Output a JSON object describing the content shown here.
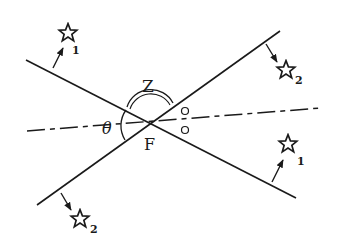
{
  "diagram": {
    "labels": {
      "zenith": "Z",
      "focus": "F",
      "angle": "θ",
      "star1_upper_sub": "1",
      "star2_upper_sub": "2",
      "star1_lower_sub": "1",
      "star2_lower_sub": "2"
    },
    "colors": {
      "ink": "#1a1a1a",
      "background": "#ffffff"
    },
    "elements": [
      "line-1 (upper-left to lower-right through F)",
      "line-2 (lower-left to upper-right through F)",
      "dash-dot axis through F",
      "double arc labeled Z above F",
      "angle arc labeled θ left of F",
      "two small circles right of F",
      "star 1 upper-left with arrow",
      "star 2 upper-right with arrow",
      "star 1 lower-right with arrow",
      "star 2 lower-left with arrow"
    ]
  }
}
